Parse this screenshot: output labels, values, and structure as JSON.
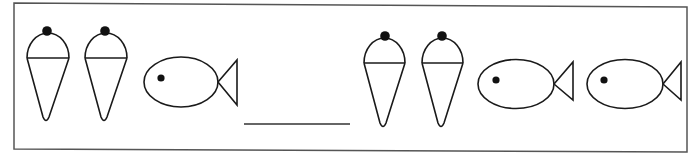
{
  "worksheet": {
    "type": "pattern-completion",
    "stroke_color": "#1a1a1a",
    "border_color": "#555555",
    "background": "#ffffff",
    "sequence": [
      {
        "kind": "ice-cream-cone",
        "label": "ice cream cone"
      },
      {
        "kind": "ice-cream-cone",
        "label": "ice cream cone"
      },
      {
        "kind": "fish",
        "label": "fish"
      },
      {
        "kind": "blank",
        "label": "answer blank"
      },
      {
        "kind": "ice-cream-cone",
        "label": "ice cream cone"
      },
      {
        "kind": "ice-cream-cone",
        "label": "ice cream cone"
      },
      {
        "kind": "fish",
        "label": "fish"
      },
      {
        "kind": "fish",
        "label": "fish"
      }
    ],
    "answer_blank": ""
  }
}
